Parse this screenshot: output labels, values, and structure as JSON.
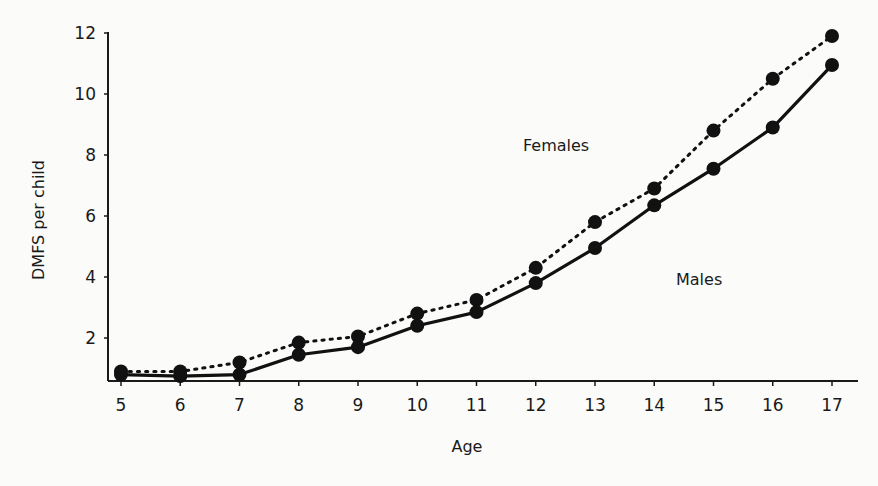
{
  "chart_data": {
    "type": "line",
    "title": "",
    "xlabel": "Age",
    "ylabel": "DMFS per child",
    "x": [
      5,
      6,
      7,
      8,
      9,
      10,
      11,
      12,
      13,
      14,
      15,
      16,
      17
    ],
    "x_tick_labels": [
      "5",
      "6",
      "7",
      "8",
      "9",
      "10",
      "11",
      "12",
      "13",
      "14",
      "15",
      "16",
      "17"
    ],
    "y_tick_labels": [
      "2",
      "4",
      "6",
      "8",
      "10",
      "12"
    ],
    "y_ticks": [
      2,
      4,
      6,
      8,
      10,
      12
    ],
    "ylim": [
      0.6,
      12.2
    ],
    "xlim": [
      4.65,
      17.4
    ],
    "grid": false,
    "legend": "inline labels",
    "series": [
      {
        "name": "Females",
        "line_style": "dotted",
        "marker": "filled-circle",
        "values": [
          0.9,
          0.9,
          1.2,
          1.85,
          2.05,
          2.8,
          3.25,
          4.3,
          5.8,
          6.9,
          8.8,
          10.5,
          11.9
        ]
      },
      {
        "name": "Males",
        "line_style": "solid",
        "marker": "filled-circle",
        "values": [
          0.8,
          0.75,
          0.8,
          1.45,
          1.7,
          2.4,
          2.85,
          3.8,
          4.95,
          6.35,
          7.55,
          8.9,
          10.95
        ]
      }
    ],
    "annotations": [
      {
        "text": "Females",
        "near_x": 13.5,
        "near_y": 7.8
      },
      {
        "text": "Males",
        "near_x": 15.3,
        "near_y": 3.5
      }
    ]
  }
}
